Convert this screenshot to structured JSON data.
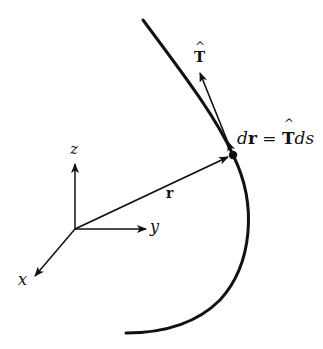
{
  "diagram": {
    "colors": {
      "stroke": "#111111",
      "background": "#ffffff"
    },
    "axes": {
      "origin": [
        75,
        229
      ],
      "z_label": "z",
      "y_label": "y",
      "x_label": "x"
    },
    "vectors": {
      "position_label": "r",
      "tangent_label": "T",
      "tangent_hat": "^"
    },
    "equation": {
      "d": "d",
      "r": "r",
      "equals": " = ",
      "T": "T",
      "ds": "ds"
    },
    "curve": {
      "point_on_curve": [
        233,
        155
      ],
      "start": [
        143,
        20
      ],
      "end": [
        126,
        333
      ]
    }
  }
}
